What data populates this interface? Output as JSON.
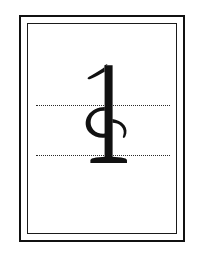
{
  "figure": {
    "kind": "glyph-plate",
    "background_color": "#ffffff"
  },
  "frame": {
    "outer_rule": {
      "label": "outer border rule",
      "color": "#111111",
      "thickness_px": 2,
      "x": 19,
      "y": 15,
      "width": 166,
      "height": 227
    },
    "inner_rule": {
      "label": "inner border rule",
      "color": "#1a1a1a",
      "thickness_px": 1,
      "x": 27,
      "y": 23,
      "width": 150,
      "height": 211
    },
    "gap_px": 7
  },
  "guides": {
    "style": "dotted",
    "color": "#2b2b2b",
    "thickness_px": 1,
    "lines": [
      {
        "name": "upper-guide",
        "y": 105,
        "x_start": 36,
        "x_end": 170
      },
      {
        "name": "lower-guide",
        "y": 155,
        "x_start": 36,
        "x_end": 170
      }
    ]
  },
  "glyph": {
    "name": "phonetic-glyph",
    "color": "#111111",
    "reading": "1",
    "components": [
      "top flag serif",
      "vertical stem",
      "left c-shaped bowl crossing the stem",
      "right curving hook tail",
      "bottom foot serif"
    ],
    "x": 78,
    "y": 62,
    "width": 52,
    "height": 106,
    "baseline_y": 155,
    "x_height_top_y": 105
  }
}
